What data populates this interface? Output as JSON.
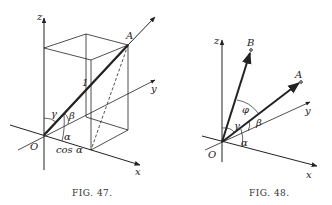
{
  "figures": [
    {
      "id": "fig47",
      "caption": "FIG. 47.",
      "labels": {
        "z": "z",
        "y": "y",
        "x": "x",
        "origin": "O",
        "point": "A",
        "length": "1",
        "alpha": "α",
        "beta": "β",
        "gamma": "γ",
        "projection": "cos α"
      }
    },
    {
      "id": "fig48",
      "caption": "FIG. 48.",
      "labels": {
        "z": "z",
        "y": "y",
        "x": "x",
        "origin": "O",
        "pointA": "A",
        "pointB": "B",
        "phi": "φ",
        "alpha": "α",
        "beta": "β",
        "gamma": "γ"
      }
    }
  ],
  "colors": {
    "ink": "#222222",
    "background": "#ffffff"
  }
}
